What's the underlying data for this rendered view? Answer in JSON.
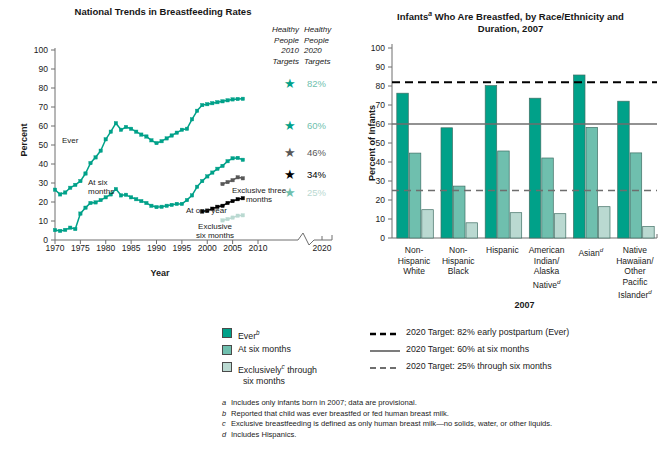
{
  "left": {
    "title": "National Trends in Breastfeeding Rates",
    "ylabel": "Percent",
    "xlabel": "Year",
    "yticks": [
      "100",
      "90",
      "80",
      "70",
      "60",
      "50",
      "40",
      "30",
      "20",
      "10",
      "0"
    ],
    "xticks": [
      "1970",
      "1975",
      "1980",
      "1985",
      "1990",
      "1995",
      "2000",
      "2005",
      "2010",
      "2020"
    ],
    "series_labels": {
      "ever": "Ever",
      "six_months": "At six\nmonths",
      "one_year": "At one year",
      "exclusive_three": "Exclusive three\nmonths",
      "exclusive_six": "Exclusive\nsix months"
    },
    "hp2010_header": "Healthy\nPeople\n2010\nTargets",
    "hp2020_header": "Healthy\nPeople\n2020\nTargets",
    "hp2020_values": [
      "82%",
      "60%",
      "46%",
      "34%",
      "25%"
    ]
  },
  "right": {
    "title": "Infantsᵃ Who Are Breastfed, by Race/Ethnicity and Duration, 2007",
    "title_line1": "Infants",
    "title_line1_sup": "a",
    "title_line1_rest": " Who Are Breastfed, by Race/Ethnicity and",
    "title_line2": "Duration, 2007",
    "ylabel": "Percent of Infants",
    "xlabel": "2007",
    "yticks": [
      "100",
      "90",
      "80",
      "70",
      "60",
      "50",
      "40",
      "30",
      "20",
      "10",
      "0"
    ]
  },
  "legend": {
    "items": [
      {
        "label": "Ever",
        "sup": "b",
        "color": "#00a189"
      },
      {
        "label": "At six months",
        "sup": "",
        "color": "#6fbfae"
      },
      {
        "label": "Exclusively",
        "sup": "c",
        "label2": " through six months",
        "color": "#bad9d1"
      }
    ],
    "targets": [
      {
        "style": "dashed-black",
        "text": "2020 Target: 82% early postpartum (Ever)"
      },
      {
        "style": "solid-gray",
        "text": "2020 Target: 60% at six months"
      },
      {
        "style": "dashed-gray",
        "text": "2020 Target: 25% through six months"
      }
    ]
  },
  "footnotes": [
    {
      "mark": "a",
      "text": "Includes only infants born in 2007; data are provisional."
    },
    {
      "mark": "b",
      "text": "Reported that child was ever breastfed or fed human breast milk."
    },
    {
      "mark": "c",
      "text": "Exclusive breastfeeding is defined as only human breast milk—no solids, water, or other liquids."
    },
    {
      "mark": "d",
      "text": "Includes Hispanics."
    }
  ],
  "colors": {
    "ever": "#00a189",
    "six_months": "#6fbfae",
    "exclusive_six": "#bad9d1",
    "exclusive_three": "#585858",
    "one_year": "#000000",
    "target_black": "#000000",
    "target_gray": "#6e6e6e"
  },
  "chart_data": [
    {
      "type": "line",
      "title": "National Trends in Breastfeeding Rates",
      "xlabel": "Year",
      "ylabel": "Percent",
      "xlim": [
        1970,
        2010
      ],
      "ylim": [
        0,
        100
      ],
      "grid": false,
      "legend": "inline-annotations",
      "x": [
        1970,
        1971,
        1972,
        1973,
        1974,
        1975,
        1976,
        1977,
        1978,
        1979,
        1980,
        1981,
        1982,
        1983,
        1984,
        1985,
        1986,
        1987,
        1988,
        1989,
        1990,
        1991,
        1992,
        1993,
        1994,
        1995,
        1996,
        1997,
        1998,
        1999,
        2000,
        2001,
        2002,
        2003,
        2004,
        2005,
        2006,
        2007
      ],
      "series": [
        {
          "name": "Ever",
          "color": "#00a189",
          "values": [
            26.5,
            24.0,
            25.0,
            27.5,
            29.0,
            31.0,
            35.0,
            40.5,
            43.5,
            47.0,
            53.0,
            57.0,
            61.5,
            58.0,
            59.5,
            58.5,
            57.0,
            55.5,
            54.5,
            52.5,
            51.0,
            52.0,
            53.5,
            55.0,
            56.5,
            58.0,
            58.5,
            63.5,
            68.0,
            71.0,
            71.5,
            72.0,
            72.5,
            73.0,
            73.5,
            74.0,
            74.2,
            74.3
          ]
        },
        {
          "name": "At six months",
          "color": "#00a189",
          "values": [
            5.2,
            4.8,
            5.3,
            6.5,
            5.8,
            13.9,
            17.0,
            19.5,
            19.8,
            21.0,
            22.5,
            24.0,
            26.8,
            23.5,
            23.8,
            22.5,
            21.5,
            20.5,
            19.5,
            18.0,
            17.3,
            17.5,
            18.0,
            18.5,
            19.0,
            19.0,
            21.0,
            23.5,
            28.0,
            31.0,
            33.5,
            35.5,
            37.5,
            39.0,
            41.5,
            43.0,
            43.2,
            42.2
          ]
        },
        {
          "name": "At one year",
          "color": "#000000",
          "x": [
            1999,
            2000,
            2001,
            2002,
            2003,
            2004,
            2005,
            2006,
            2007
          ],
          "values": [
            15.0,
            15.5,
            16.5,
            17.5,
            18.0,
            19.5,
            20.5,
            21.5,
            22.0
          ]
        },
        {
          "name": "Exclusive three months",
          "color": "#585858",
          "x": [
            2003,
            2004,
            2005,
            2006,
            2007
          ],
          "values": [
            29.5,
            30.5,
            31.5,
            33.0,
            32.5
          ]
        },
        {
          "name": "Exclusive six months",
          "color": "#bad9d1",
          "x": [
            2003,
            2004,
            2005,
            2006,
            2007
          ],
          "values": [
            10.3,
            11.0,
            11.8,
            12.8,
            13.0
          ]
        }
      ],
      "annotations": [
        {
          "text": "Healthy People 2020 Target",
          "value": 82,
          "marker": "star",
          "color": "#00a189"
        },
        {
          "text": "Healthy People 2020 Target",
          "value": 60,
          "marker": "star",
          "color": "#00a189"
        },
        {
          "text": "Healthy People 2010 Target",
          "value": 46,
          "marker": "star",
          "color": "#585858"
        },
        {
          "text": "Healthy People 2010 Target",
          "value": 34,
          "marker": "star",
          "color": "#000000"
        },
        {
          "text": "Healthy People 2020 Target",
          "value": 25,
          "marker": "star",
          "color": "#6fbfae"
        }
      ]
    },
    {
      "type": "bar",
      "title": "Infants Who Are Breastfed, by Race/Ethnicity and Duration, 2007",
      "xlabel": "2007",
      "ylabel": "Percent of Infants",
      "ylim": [
        0,
        100
      ],
      "grid": false,
      "legend": "bottom",
      "categories": [
        "Non-Hispanic White",
        "Non-Hispanic Black",
        "Hispanic",
        "American Indian/Alaska Native",
        "Asian",
        "Native Hawaiian/Other Pacific Islander"
      ],
      "category_lines": [
        [
          "Non-",
          "Hispanic",
          "White"
        ],
        [
          "Non-",
          "Hispanic",
          "Black"
        ],
        [
          "Hispanic"
        ],
        [
          "American",
          "Indian/",
          "Alaska",
          "Native"
        ],
        [
          "Asian"
        ],
        [
          "Native",
          "Hawaiian/",
          "Other",
          "Pacific",
          "Islander"
        ]
      ],
      "category_sup": [
        "",
        "",
        "",
        "d",
        "d",
        "d"
      ],
      "series": [
        {
          "name": "Ever",
          "color": "#00a189",
          "values": [
            76.2,
            58.0,
            80.2,
            73.6,
            85.8,
            72.0
          ]
        },
        {
          "name": "At six months",
          "color": "#6fbfae",
          "values": [
            44.7,
            27.3,
            45.8,
            42.1,
            58.2,
            44.8
          ]
        },
        {
          "name": "Exclusively through six months",
          "color": "#bad9d1",
          "values": [
            14.9,
            8.0,
            13.3,
            12.8,
            16.5,
            6.0
          ]
        }
      ],
      "reference_lines": [
        {
          "value": 82,
          "style": "dashed",
          "color": "#000000",
          "label": "2020 Target: 82% early postpartum (Ever)"
        },
        {
          "value": 60,
          "style": "solid",
          "color": "#6e6e6e",
          "label": "2020 Target: 60% at six months"
        },
        {
          "value": 25,
          "style": "dashed",
          "color": "#6e6e6e",
          "label": "2020 Target: 25% through six months"
        }
      ]
    }
  ]
}
